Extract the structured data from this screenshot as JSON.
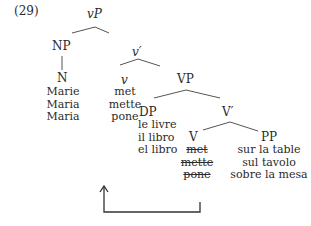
{
  "example_number": "(29)",
  "nodes": {
    "vP": "vP",
    "NP": "NP",
    "v_bar": "v′",
    "N": "N",
    "v": "v",
    "VP": "VP",
    "DP": "DP",
    "V_bar": "V′",
    "V": "V",
    "PP": "PP"
  },
  "leaves": {
    "N": [
      "Marie",
      "Maria",
      "Maria"
    ],
    "v": [
      "met",
      "mette",
      "pone"
    ],
    "DP": [
      "le livre",
      "il libro",
      "el libro"
    ],
    "V_struck": [
      "met",
      "mette",
      "pone"
    ],
    "PP": [
      "sur la table",
      "sul tavolo",
      "sobre la mesa"
    ]
  },
  "movement_arrow": {
    "from": "V",
    "to": "v",
    "label": ""
  }
}
